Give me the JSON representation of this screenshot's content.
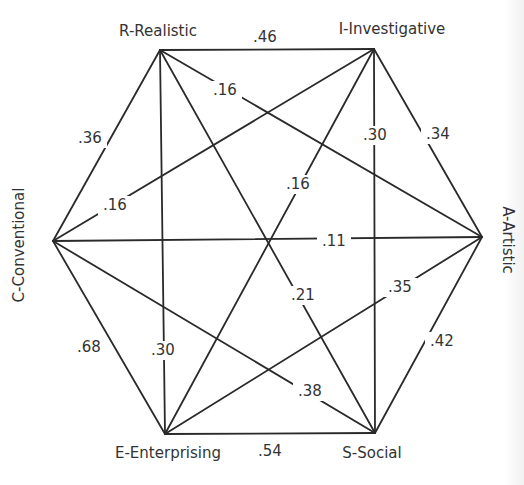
{
  "diagram": {
    "type": "hexagon-correlation-network",
    "nodes": [
      {
        "id": "R",
        "label": "R-Realistic",
        "x": 160,
        "y": 50,
        "lx": 158,
        "ly": 36,
        "rotate": 0,
        "anchor": "middle"
      },
      {
        "id": "I",
        "label": "I-Investigative",
        "x": 374,
        "y": 49,
        "lx": 392,
        "ly": 34,
        "rotate": 0,
        "anchor": "middle"
      },
      {
        "id": "A",
        "label": "A-Artistic",
        "x": 482,
        "y": 237,
        "lx": 507,
        "ly": 240,
        "rotate": 90,
        "anchor": "middle"
      },
      {
        "id": "S",
        "label": "S-Social",
        "x": 375,
        "y": 433,
        "lx": 372,
        "ly": 458,
        "rotate": 0,
        "anchor": "middle"
      },
      {
        "id": "E",
        "label": "E-Enterprising",
        "x": 165,
        "y": 434,
        "lx": 168,
        "ly": 458,
        "rotate": 0,
        "anchor": "middle"
      },
      {
        "id": "C",
        "label": "C-Conventional",
        "x": 53,
        "y": 241,
        "lx": 19,
        "ly": 245,
        "rotate": -90,
        "anchor": "middle"
      }
    ],
    "edges": [
      {
        "from": "R",
        "to": "I",
        "weight": ".46",
        "lx": 265,
        "ly": 42,
        "gap": false
      },
      {
        "from": "I",
        "to": "A",
        "weight": ".34",
        "lx": 438,
        "ly": 139,
        "gap": true
      },
      {
        "from": "A",
        "to": "S",
        "weight": ".42",
        "lx": 442,
        "ly": 346,
        "gap": true
      },
      {
        "from": "S",
        "to": "E",
        "weight": ".54",
        "lx": 270,
        "ly": 456,
        "gap": false
      },
      {
        "from": "E",
        "to": "C",
        "weight": ".68",
        "lx": 89,
        "ly": 352,
        "gap": true
      },
      {
        "from": "C",
        "to": "R",
        "weight": ".36",
        "lx": 90,
        "ly": 143,
        "gap": true
      },
      {
        "from": "R",
        "to": "A",
        "weight": ".16",
        "lx": 225,
        "ly": 95,
        "gap": true
      },
      {
        "from": "R",
        "to": "S",
        "weight": ".21",
        "lx": 303,
        "ly": 300,
        "gap": true
      },
      {
        "from": "R",
        "to": "E",
        "weight": ".30",
        "lx": 163,
        "ly": 355,
        "gap": true
      },
      {
        "from": "I",
        "to": "C",
        "weight": ".16",
        "lx": 115,
        "ly": 210,
        "gap": true
      },
      {
        "from": "I",
        "to": "S",
        "weight": ".30",
        "lx": 375,
        "ly": 140,
        "gap": true
      },
      {
        "from": "I",
        "to": "E",
        "weight": ".16",
        "lx": 298,
        "ly": 189,
        "gap": true
      },
      {
        "from": "C",
        "to": "A",
        "weight": ".11",
        "lx": 334,
        "ly": 246,
        "gap": true
      },
      {
        "from": "C",
        "to": "S",
        "weight": ".38",
        "lx": 310,
        "ly": 396,
        "gap": true
      },
      {
        "from": "A",
        "to": "E",
        "weight": ".35",
        "lx": 400,
        "ly": 292,
        "gap": true
      }
    ]
  }
}
